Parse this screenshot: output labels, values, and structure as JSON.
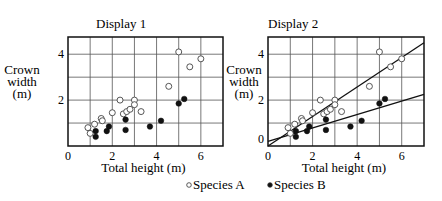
{
  "chart_data": [
    {
      "type": "scatter",
      "title": "Display 1",
      "xlabel": "Total height (m)",
      "ylabel": [
        "Crown",
        "width",
        "(m)"
      ],
      "xlim": [
        0,
        7
      ],
      "ylim": [
        0,
        4.75
      ],
      "xticks": [
        0,
        2,
        4,
        6
      ],
      "yticks": [
        2,
        4
      ],
      "grid": true,
      "series": [
        {
          "name": "Species A",
          "marker": "open-circle",
          "points": [
            [
              0.9,
              0.8
            ],
            [
              1.0,
              0.55
            ],
            [
              1.2,
              0.95
            ],
            [
              1.5,
              1.2
            ],
            [
              1.55,
              1.1
            ],
            [
              2.0,
              1.45
            ],
            [
              2.35,
              2.0
            ],
            [
              2.5,
              1.4
            ],
            [
              2.65,
              1.5
            ],
            [
              2.8,
              1.6
            ],
            [
              3.0,
              2.0
            ],
            [
              3.0,
              1.8
            ],
            [
              3.3,
              1.5
            ],
            [
              4.55,
              2.6
            ],
            [
              5.0,
              4.1
            ],
            [
              5.5,
              3.45
            ],
            [
              6.0,
              3.8
            ]
          ]
        },
        {
          "name": "Species B",
          "marker": "filled-circle",
          "points": [
            [
              1.25,
              0.65
            ],
            [
              1.25,
              0.4
            ],
            [
              1.75,
              0.65
            ],
            [
              1.85,
              0.85
            ],
            [
              2.6,
              0.7
            ],
            [
              2.6,
              1.15
            ],
            [
              3.7,
              0.85
            ],
            [
              4.2,
              1.1
            ],
            [
              5.0,
              1.85
            ],
            [
              5.25,
              2.05
            ]
          ]
        }
      ]
    },
    {
      "type": "scatter",
      "title": "Display 2",
      "xlabel": "Total height (m)",
      "ylabel": [
        "Crown",
        "width",
        "(m)"
      ],
      "xlim": [
        0,
        7
      ],
      "ylim": [
        0,
        4.75
      ],
      "xticks": [
        0,
        2,
        4,
        6
      ],
      "yticks": [
        0,
        2,
        4
      ],
      "grid": true,
      "series": [
        {
          "name": "Species A",
          "marker": "open-circle",
          "points": [
            [
              0.9,
              0.8
            ],
            [
              1.0,
              0.55
            ],
            [
              1.2,
              0.95
            ],
            [
              1.5,
              1.2
            ],
            [
              1.55,
              1.1
            ],
            [
              2.0,
              1.45
            ],
            [
              2.35,
              2.0
            ],
            [
              2.5,
              1.4
            ],
            [
              2.65,
              1.5
            ],
            [
              2.8,
              1.6
            ],
            [
              3.0,
              2.0
            ],
            [
              3.0,
              1.8
            ],
            [
              3.3,
              1.5
            ],
            [
              4.55,
              2.6
            ],
            [
              5.0,
              4.1
            ],
            [
              5.5,
              3.45
            ],
            [
              6.0,
              3.8
            ]
          ],
          "fit_line": {
            "x0": 0,
            "y0": 0.0,
            "x1": 7,
            "y1": 4.5
          }
        },
        {
          "name": "Species B",
          "marker": "filled-circle",
          "points": [
            [
              1.25,
              0.65
            ],
            [
              1.25,
              0.4
            ],
            [
              1.75,
              0.65
            ],
            [
              1.85,
              0.85
            ],
            [
              2.6,
              0.7
            ],
            [
              2.6,
              1.15
            ],
            [
              3.7,
              0.85
            ],
            [
              4.2,
              1.1
            ],
            [
              5.0,
              1.85
            ],
            [
              5.25,
              2.05
            ]
          ],
          "fit_line": {
            "x0": 0,
            "y0": 0.2,
            "x1": 7,
            "y1": 2.25
          }
        }
      ]
    }
  ],
  "legend": {
    "placement": "bottom-center",
    "items": [
      {
        "label": "Species A",
        "marker": "open-circle"
      },
      {
        "label": "Species B",
        "marker": "filled-circle"
      }
    ]
  }
}
